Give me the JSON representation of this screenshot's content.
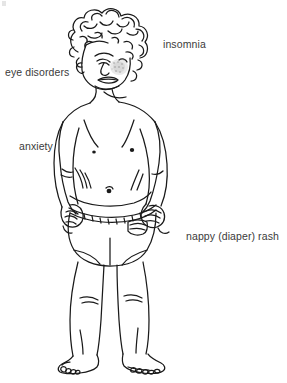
{
  "figure": {
    "background_color": "#ffffff",
    "line_color": "#1a1a1a",
    "text_color": "#3b3b3b",
    "shading_color": "#9a9a9a",
    "labels": [
      {
        "id": "insomnia",
        "text": "insomnia"
      },
      {
        "id": "eye_disorders",
        "text": "eye disorders"
      },
      {
        "id": "anxiety",
        "text": "anxiety"
      },
      {
        "id": "nappy_rash",
        "text": "nappy (diaper) rash"
      }
    ]
  }
}
